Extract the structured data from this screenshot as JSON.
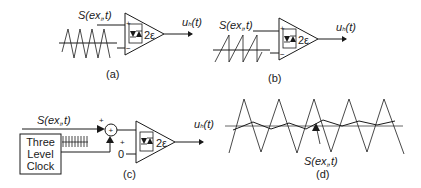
{
  "panels": {
    "a": {
      "caption": "(a)",
      "input_label": "S(ex",
      "input_label_sub": "i",
      "input_label_tail": ",t)",
      "output_label": "u",
      "output_sub": "h",
      "output_tail": "(t)",
      "hysteresis_label": "2ε",
      "plus_sign": "+",
      "minus_sign": "−",
      "waveform": "triangle"
    },
    "b": {
      "caption": "(b)",
      "input_label": "S(ex",
      "input_label_sub": "i",
      "input_label_tail": ",t)",
      "output_label": "u",
      "output_sub": "h",
      "output_tail": "(t)",
      "hysteresis_label": "2ε",
      "plus_sign": "+",
      "minus_sign": "−",
      "waveform": "sawtooth"
    },
    "c": {
      "caption": "(c)",
      "input_label": "S(ex",
      "input_label_sub": "i",
      "input_label_tail": ",t)",
      "output_label": "u",
      "output_sub": "h",
      "output_tail": "(t)",
      "hysteresis_label": "2ε",
      "clock_lines": [
        "Three",
        "Level",
        "Clock"
      ],
      "sum_symbol": "+",
      "sum_plus_top": "+",
      "sum_plus_bottom": "+",
      "zero_label": "0"
    },
    "d": {
      "caption": "(d)",
      "signal_label": "S(ex",
      "signal_label_sub": "i",
      "signal_label_tail": ",t)"
    }
  }
}
